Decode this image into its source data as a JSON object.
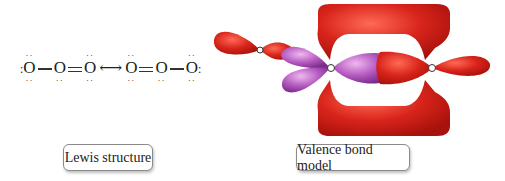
{
  "lewis": {
    "structure_1": [
      "O",
      "O",
      "O"
    ],
    "structure_2": [
      "O",
      "O",
      "O"
    ],
    "bonds_1": [
      "single",
      "double"
    ],
    "bonds_2": [
      "double",
      "single"
    ],
    "resonance_arrow": "⟷"
  },
  "labels": {
    "lewis": "Lewis structure",
    "valence_bond": "Valence bond model"
  },
  "colors": {
    "sigma_lobe": "#d8241b",
    "pi_lobe": "#b45ac0",
    "label_border": "#8a8a8a"
  }
}
